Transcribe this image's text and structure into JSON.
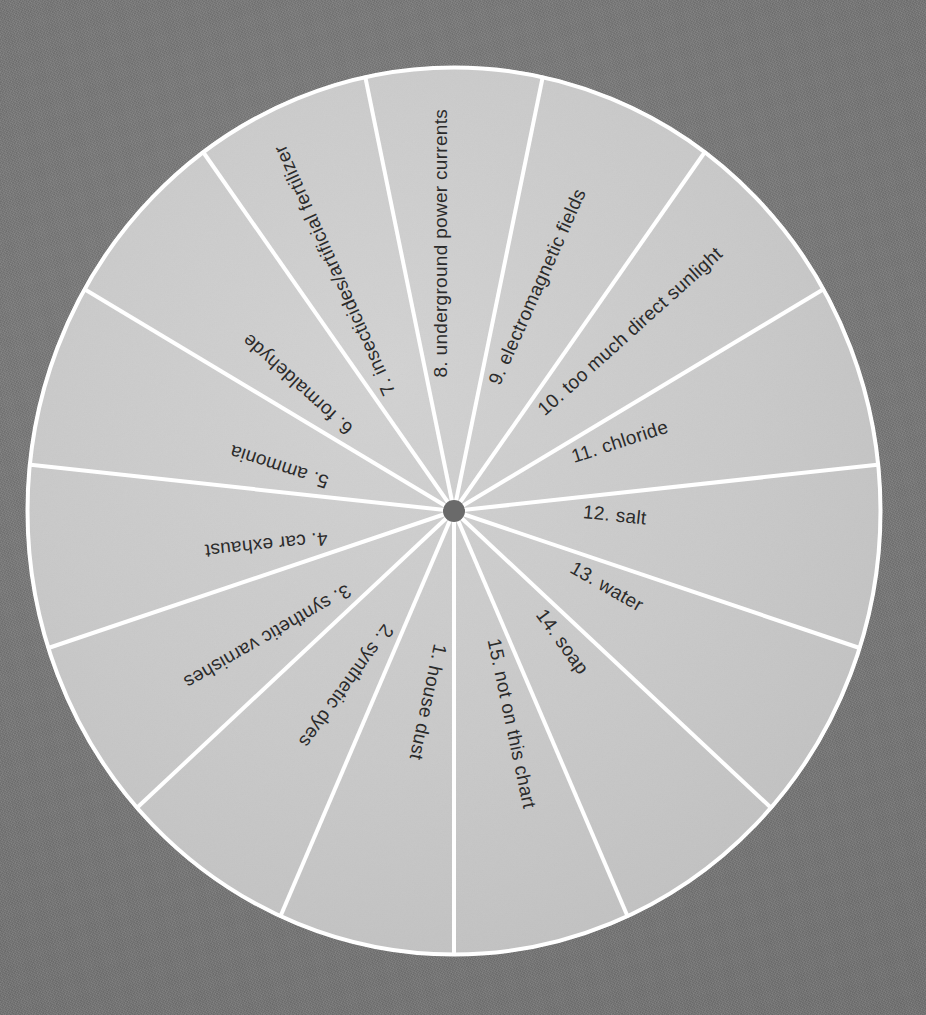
{
  "chart_data": {
    "type": "pie",
    "title": "",
    "subtitle": "",
    "xlabel": "",
    "ylabel": "",
    "legend_position": "none",
    "grid": false,
    "equal_slices": true,
    "slice_count": 15,
    "slice_angle_degrees": 24,
    "start_angle_degrees": 0,
    "direction": "clockwise-from-top-for-numbering-descending",
    "categories": [
      "1. house dust",
      "2. synthetic dyes",
      "3. synthetic varnishes",
      "4. car exhaust",
      "5. ammonia",
      "6. formaldehyde",
      "7. insecticides/artificial fertilizer",
      "8. underground power currents",
      "9. electromagnetic fields",
      "10. too much direct sunlight",
      "11. chloride",
      "12. salt",
      "13. water",
      "14. soap",
      "15. not on this chart"
    ],
    "values": [
      1,
      1,
      1,
      1,
      1,
      1,
      1,
      1,
      1,
      1,
      1,
      1,
      1,
      1,
      1
    ],
    "percentages": [
      6.67,
      6.67,
      6.67,
      6.67,
      6.67,
      6.67,
      6.67,
      6.67,
      6.67,
      6.67,
      6.67,
      6.67,
      6.67,
      6.67,
      6.67
    ]
  },
  "wheel": {
    "center_x": 454,
    "center_y": 511,
    "radius_x": 428,
    "radius_y": 445,
    "hub_radius": 11,
    "slices": [
      {
        "number": "1.",
        "text": "house dust",
        "label": "1. house dust",
        "mid_angle": 192
      },
      {
        "number": "2.",
        "text": "synthetic dyes",
        "label": "2. synthetic dyes",
        "mid_angle": 216
      },
      {
        "number": "3.",
        "text": "synthetic varnishes",
        "label": "3. synthetic varnishes",
        "mid_angle": 240
      },
      {
        "number": "4.",
        "text": "car exhaust",
        "label": "4. car exhaust",
        "mid_angle": 264
      },
      {
        "number": "5.",
        "text": "ammonia",
        "label": "5. ammonia",
        "mid_angle": 288
      },
      {
        "number": "6.",
        "text": "formaldehyde",
        "label": "6. formaldehyde",
        "mid_angle": 312
      },
      {
        "number": "7.",
        "text": "insecticides/artificial fertilizer",
        "label": "7. insecticides/artificial fertilizer",
        "mid_angle": 336
      },
      {
        "number": "8.",
        "text": "underground power currents",
        "label": "8. underground power currents",
        "mid_angle": 0
      },
      {
        "number": "9.",
        "text": "electromagnetic fields",
        "label": "9. electromagnetic fields",
        "mid_angle": 24
      },
      {
        "number": "10.",
        "text": "too much direct sunlight",
        "label": "10. too much direct sunlight",
        "mid_angle": 48
      },
      {
        "number": "11.",
        "text": "chloride",
        "label": "11. chloride",
        "mid_angle": 72
      },
      {
        "number": "12.",
        "text": "salt",
        "label": "12. salt",
        "mid_angle": 96
      },
      {
        "number": "13.",
        "text": "water",
        "label": "13. water",
        "mid_angle": 120
      },
      {
        "number": "14.",
        "text": "soap",
        "label": "14. soap",
        "mid_angle": 144
      },
      {
        "number": "15.",
        "text": "not on this chart",
        "label": "15. not on this chart",
        "mid_angle": 168
      }
    ]
  },
  "colors": {
    "background": "#767676",
    "disc_fill": "#c8c8c8",
    "divider": "#ffffff",
    "hub": "#6a6a6a",
    "label_text": "#2b2b2b"
  }
}
